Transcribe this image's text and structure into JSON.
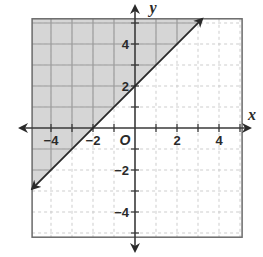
{
  "chart_data": {
    "type": "line",
    "title": "",
    "xlabel": "x",
    "ylabel": "y",
    "origin_label": "O",
    "xlim": [
      -4.9,
      5.1
    ],
    "ylim": [
      -5.2,
      5.2
    ],
    "grid": true,
    "grid_step": 1,
    "x_ticks": [
      -4,
      -2,
      2,
      4
    ],
    "x_tick_labels": [
      "−4",
      "−2",
      "2",
      "4"
    ],
    "y_ticks": [
      -4,
      -2,
      2,
      4
    ],
    "y_tick_labels": [
      "−4",
      "−2",
      "2",
      "4"
    ],
    "series": [
      {
        "name": "boundary line y = x + 2",
        "equation": "y = x + 2",
        "slope": 1,
        "intercept": 2,
        "style": "solid",
        "arrows": "both",
        "points": [
          [
            -4.9,
            -2.9
          ],
          [
            -2,
            0
          ],
          [
            0,
            2
          ],
          [
            3.2,
            5.2
          ]
        ]
      }
    ],
    "shaded_region": {
      "description": "region above the line y = x + 2 (y > x + 2)",
      "inequality": "y > x + 2",
      "color": "#d6d6d6"
    },
    "key_points": [
      {
        "label": "x-intercept",
        "x": -2,
        "y": 0
      },
      {
        "label": "y-intercept",
        "x": 0,
        "y": 2
      }
    ]
  },
  "colors": {
    "shade": "#d6d6d6",
    "grid_shaded": "#9c9c9c",
    "grid_unshaded": "#cdcdcd",
    "axis": "#3a3a3a",
    "border": "#6a6a6a",
    "line": "#2a2a2a"
  }
}
